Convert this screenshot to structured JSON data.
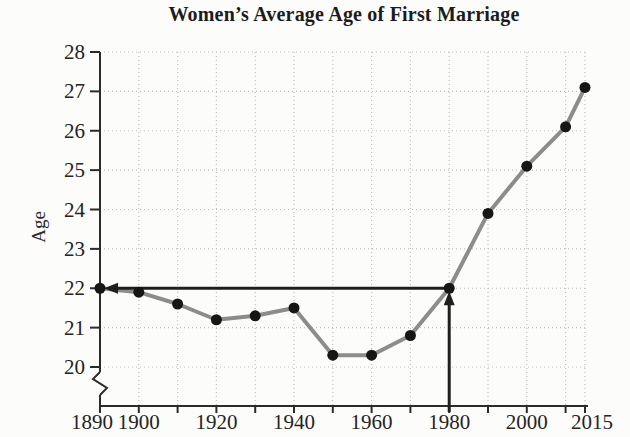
{
  "figure": {
    "background": "#fcfcfa"
  },
  "chart_data": {
    "type": "line",
    "title": "Women’s Average Age of First Marriage",
    "xlabel": "",
    "ylabel": "Age",
    "x": [
      1890,
      1900,
      1910,
      1920,
      1930,
      1940,
      1950,
      1960,
      1970,
      1980,
      1990,
      2000,
      2010,
      2015
    ],
    "values": [
      22.0,
      21.9,
      21.6,
      21.2,
      21.3,
      21.5,
      20.3,
      20.3,
      20.8,
      22.0,
      23.9,
      25.1,
      26.1,
      27.1
    ],
    "xlim": [
      1890,
      2015
    ],
    "ylim": [
      20,
      28
    ],
    "y_ticks": [
      28,
      27,
      26,
      25,
      24,
      23,
      22,
      21,
      20
    ],
    "x_ticks": [
      1890,
      1900,
      1910,
      1920,
      1930,
      1940,
      1950,
      1960,
      1970,
      1980,
      1990,
      2000,
      2010,
      2015
    ],
    "x_tick_labels_shown": [
      "1890",
      "1900",
      "1920",
      "1940",
      "1960",
      "1980",
      "2000",
      "2015"
    ],
    "grid": "dotted",
    "axis_break_below": 20,
    "annotation": {
      "type": "trace-arrows",
      "x": 1980,
      "y": 22,
      "description": "vertical arrow up from 1980 on x-axis to the curve, horizontal arrow left from the curve to age 22 on y-axis"
    },
    "colors": {
      "line": "#8c8c8c",
      "point": "#161616",
      "annotation": "#1f1f1f",
      "grid": "#bdbdbd",
      "axis": "#2b2b2b",
      "text": "#242424"
    }
  }
}
